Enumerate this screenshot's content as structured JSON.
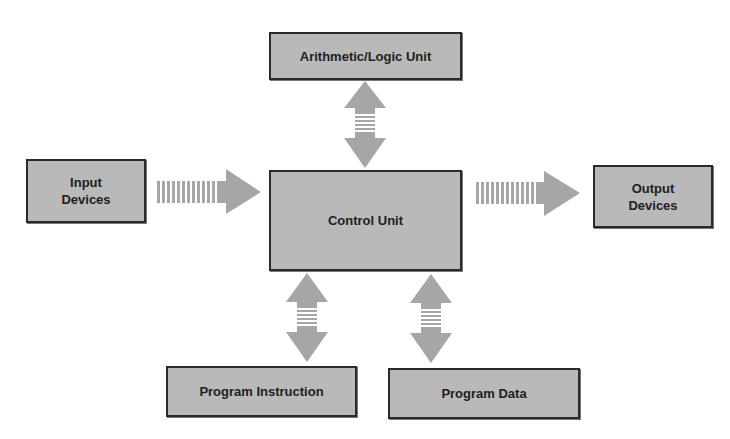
{
  "diagram": {
    "colors": {
      "box_fill": "#b9b9b9",
      "box_border": "#2a2a2a",
      "arrow": "#a6a6a6",
      "text": "#1e1e1e"
    },
    "nodes": {
      "alu": {
        "label": "Arithmetic/Logic Unit"
      },
      "control": {
        "label": "Control Unit"
      },
      "input": {
        "label": "Input\nDevices"
      },
      "output": {
        "label": "Output\nDevices"
      },
      "instruction": {
        "label": "Program Instruction"
      },
      "data": {
        "label": "Program Data"
      }
    },
    "edges": [
      {
        "from": "input",
        "to": "control",
        "type": "one-way"
      },
      {
        "from": "control",
        "to": "output",
        "type": "one-way"
      },
      {
        "from": "alu",
        "to": "control",
        "type": "two-way"
      },
      {
        "from": "control",
        "to": "instruction",
        "type": "two-way"
      },
      {
        "from": "control",
        "to": "data",
        "type": "two-way"
      }
    ]
  }
}
